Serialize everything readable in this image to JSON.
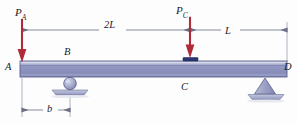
{
  "figure": {
    "background_color": "#fdfdfd"
  },
  "colors": {
    "load_arrow": "#b02a3a",
    "beam_body": "#8e93bd",
    "beam_top_highlight": "#c9cde4",
    "beam_outline": "#5a5f8c",
    "support": "#a0a5c6",
    "support_outline": "#5a5f8c",
    "bearing_plate": "#2b3570",
    "dimension_line": "#6b6f86",
    "text": "#1b1b2b"
  },
  "loads": [
    {
      "name": "load-pa",
      "symbol": "P",
      "subscript": "A",
      "x": 22,
      "applied_at": "A",
      "direction": "down"
    },
    {
      "name": "load-pc",
      "symbol": "P",
      "subscript": "C",
      "x": 190,
      "applied_at": "C",
      "direction": "down"
    }
  ],
  "dimensions": [
    {
      "name": "dimension-2l",
      "label": "2L",
      "from": "A",
      "to": "C",
      "x_start": 22,
      "x_end": 190,
      "y": 30,
      "placement": "above-beam"
    },
    {
      "name": "dimension-l",
      "label": "L",
      "from": "C",
      "to": "D",
      "x_start": 190,
      "x_end": 287,
      "y": 30,
      "placement": "above-beam"
    },
    {
      "name": "dimension-b",
      "label": "b",
      "from": "A",
      "to": "B",
      "x_start": 22,
      "x_end": 70,
      "y": 110,
      "placement": "below-beam"
    }
  ],
  "points": [
    {
      "name": "point-a",
      "label": "A",
      "x": 22,
      "position": "left-end"
    },
    {
      "name": "point-b",
      "label": "B",
      "x": 70,
      "position": "above-beam-at-roller"
    },
    {
      "name": "point-c",
      "label": "C",
      "x": 190,
      "position": "below-beam-at-load"
    },
    {
      "name": "point-d",
      "label": "D",
      "x": 287,
      "position": "right-end"
    }
  ],
  "supports": [
    {
      "name": "support-roller-b",
      "type": "roller",
      "at": "B",
      "x": 70,
      "label": "B"
    },
    {
      "name": "support-pin-d",
      "type": "pin",
      "at": "D",
      "x": 265,
      "label": "D"
    }
  ],
  "beam": {
    "name": "beam",
    "x_start": 20,
    "x_end": 287,
    "y_top": 61,
    "y_bottom": 77
  }
}
